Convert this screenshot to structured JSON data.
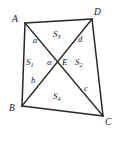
{
  "figure": {
    "stroke_color": "#262626",
    "background_color": "#ffffff",
    "vertices": [
      {
        "name": "A",
        "label": "A",
        "x": 25,
        "y": 23,
        "label_x": 12,
        "label_y": 15
      },
      {
        "name": "D",
        "label": "D",
        "x": 92,
        "y": 19,
        "label_x": 94,
        "label_y": 8
      },
      {
        "name": "C",
        "label": "C",
        "x": 103,
        "y": 116,
        "label_x": 105,
        "label_y": 118
      },
      {
        "name": "B",
        "label": "B",
        "x": 22,
        "y": 106,
        "label_x": 9,
        "label_y": 104
      }
    ],
    "intersection": {
      "name": "E",
      "label": "E",
      "x": 60,
      "y": 64,
      "label_x": 62,
      "label_y": 58
    },
    "segments": [
      {
        "name": "a",
        "label": "a",
        "from": "A",
        "to": "E",
        "label_x": 33,
        "label_y": 36
      },
      {
        "name": "d",
        "label": "d",
        "from": "D",
        "to": "E",
        "label_x": 78,
        "label_y": 35
      },
      {
        "name": "b",
        "label": "b",
        "from": "B",
        "to": "E",
        "label_x": 31,
        "label_y": 76
      },
      {
        "name": "c",
        "label": "c",
        "from": "C",
        "to": "E",
        "label_x": 84,
        "label_y": 84
      }
    ],
    "angle": {
      "label": "α",
      "at": "E",
      "label_x": 47,
      "label_y": 58
    },
    "regions": [
      {
        "name": "S1",
        "label": "S",
        "subscript": "1",
        "label_x": 26,
        "label_y": 58
      },
      {
        "name": "S2",
        "label": "S",
        "subscript": "2",
        "label_x": 75,
        "label_y": 58
      },
      {
        "name": "S3",
        "label": "S",
        "subscript": "3",
        "label_x": 53,
        "label_y": 30
      },
      {
        "name": "S4",
        "label": "S",
        "subscript": "4",
        "label_x": 53,
        "label_y": 92
      }
    ],
    "edges": [
      {
        "name": "edge-AD",
        "from": "A",
        "to": "D"
      },
      {
        "name": "edge-DC",
        "from": "D",
        "to": "C"
      },
      {
        "name": "edge-CB",
        "from": "C",
        "to": "B"
      },
      {
        "name": "edge-BA",
        "from": "B",
        "to": "A"
      }
    ],
    "diagonals": [
      {
        "name": "diagonal-AC",
        "from": "A",
        "to": "C"
      },
      {
        "name": "diagonal-BD",
        "from": "B",
        "to": "D"
      }
    ]
  }
}
